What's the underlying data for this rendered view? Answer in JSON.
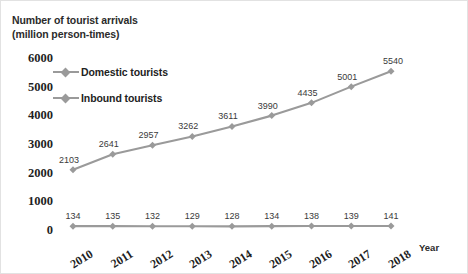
{
  "chart_data": {
    "type": "line",
    "title": "Number of tourist arrivals",
    "subtitle": "(million person-times)",
    "xlabel": "Year",
    "ylabel": "",
    "grid": false,
    "legend_position": "upper-left-inside",
    "ylim": [
      0,
      6000
    ],
    "yticks": [
      "6000",
      "5000",
      "4000",
      "3000",
      "2000",
      "1000",
      "0"
    ],
    "ytick_values": [
      6000,
      5000,
      4000,
      3000,
      2000,
      1000,
      0
    ],
    "categories": [
      "2010",
      "2011",
      "2012",
      "2013",
      "2014",
      "2015",
      "2016",
      "2017",
      "2018"
    ],
    "series": [
      {
        "name": "Domestic tourists",
        "color": "#9a9a9a",
        "marker": "diamond",
        "values": [
          2103,
          2641,
          2957,
          3262,
          3611,
          3990,
          4435,
          5001,
          5540
        ],
        "labels": [
          "2103",
          "2641",
          "2957",
          "3262",
          "3611",
          "3990",
          "4435",
          "5001",
          "5540"
        ]
      },
      {
        "name": "Inbound tourists",
        "color": "#9a9a9a",
        "marker": "diamond",
        "values": [
          134,
          135,
          132,
          129,
          128,
          134,
          138,
          139,
          141
        ],
        "labels": [
          "134",
          "135",
          "132",
          "129",
          "128",
          "134",
          "138",
          "139",
          "141"
        ]
      }
    ]
  },
  "colors": {
    "series_gray": "#9a9a9a",
    "text_dark": "#1f1f1f",
    "label_gray": "#3a3a3a",
    "frame": "#e2e2e2"
  }
}
